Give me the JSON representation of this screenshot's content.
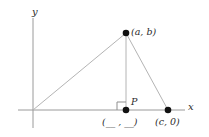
{
  "figure": {
    "type": "coordinate-geometry-diagram",
    "background_color": "#ffffff",
    "axis_color": "#9a9a9a",
    "line_color": "#b0b0b0",
    "point_color": "#111111",
    "text_color": "#2b2b2b"
  },
  "axes": {
    "x_label": "x",
    "y_label": "y",
    "origin": {
      "x": 33,
      "y": 110
    },
    "x_axis": {
      "x1": 18,
      "y1": 110,
      "x2": 185,
      "y2": 110
    },
    "y_axis": {
      "x1": 33,
      "y1": 18,
      "x2": 33,
      "y2": 128
    }
  },
  "points": [
    {
      "name": "apex",
      "label": "(a, b)",
      "x": 126,
      "y": 33,
      "dot": true
    },
    {
      "name": "foot-of-altitude",
      "label": "P",
      "x": 126,
      "y": 110,
      "dot": true
    },
    {
      "name": "right-vertex",
      "label": "(c, 0)",
      "x": 168,
      "y": 110,
      "dot": true
    }
  ],
  "labels": {
    "apex": "(a, b)",
    "p": "P",
    "right_vertex": "(c, 0)",
    "blank_coordinate": "(__ , __)"
  },
  "triangle": {
    "vertices": [
      {
        "x": 33,
        "y": 110
      },
      {
        "x": 126,
        "y": 33
      },
      {
        "x": 168,
        "y": 110
      }
    ]
  },
  "altitude": {
    "x1": 126,
    "y1": 33,
    "x2": 126,
    "y2": 110
  },
  "right_angle_marker": {
    "x": 117,
    "y": 101,
    "size": 8
  }
}
